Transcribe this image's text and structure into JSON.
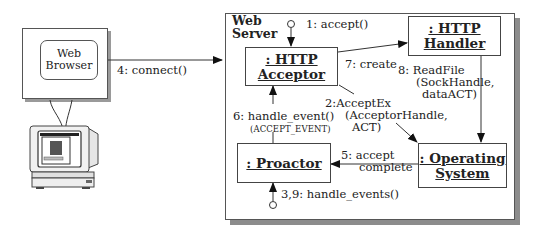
{
  "diagram": {
    "type": "uml-collaboration",
    "client": {
      "container_label": "Web Browser",
      "line1": "Web",
      "line2": "Browser",
      "icon": "computer-monitor-icon"
    },
    "server": {
      "title_line1": "Web",
      "title_line2": "Server"
    },
    "objects": {
      "acceptor": {
        "line1": ": HTTP",
        "line2": "Acceptor"
      },
      "handler": {
        "line1": ": HTTP",
        "line2": "Handler"
      },
      "proactor": {
        "line1": ": Proactor"
      },
      "os": {
        "line1": ": Operating",
        "line2": "System"
      }
    },
    "messages": {
      "connect": "4: connect()",
      "accept": "1: accept()",
      "create": "7: create",
      "readfile_1": "8: ReadFile",
      "readfile_2": "(SockHandle,",
      "readfile_3": "dataACT)",
      "acceptex_1": "2:AcceptEx",
      "acceptex_2": "(AcceptorHandle,",
      "acceptex_3": "ACT)",
      "handle_event": "6: handle_event()",
      "accept_event": "(ACCEPT_EVENT)",
      "accept_complete_1": "5: accept",
      "accept_complete_2": "complete",
      "handle_events": "3,9: handle_events()"
    }
  }
}
